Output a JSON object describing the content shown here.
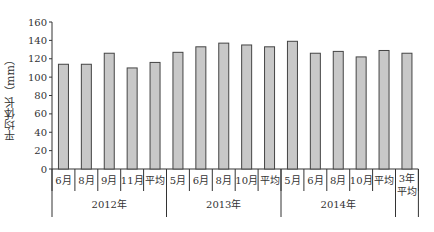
{
  "chart_data": {
    "type": "bar",
    "title": "",
    "xlabel": "",
    "ylabel": "平均体长（mm）",
    "ylim": [
      0,
      160
    ],
    "yticks": [
      0,
      20,
      40,
      60,
      80,
      100,
      120,
      140,
      160
    ],
    "grid": false,
    "legend": null,
    "bar_color": "#c8c8c8",
    "bar_edge_color": "#444444",
    "categories": [
      "6月",
      "8月",
      "9月",
      "11月",
      "平均",
      "5月",
      "6月",
      "8月",
      "10月",
      "平均",
      "5月",
      "6月",
      "8月",
      "10月",
      "平均",
      "3年平均"
    ],
    "groups": [
      {
        "label": "2012年",
        "categories": [
          "6月",
          "8月",
          "9月",
          "11月",
          "平均"
        ],
        "values": [
          114,
          114,
          126,
          110,
          116
        ]
      },
      {
        "label": "2013年",
        "categories": [
          "5月",
          "6月",
          "8月",
          "10月",
          "平均"
        ],
        "values": [
          127,
          133,
          137,
          135,
          133
        ]
      },
      {
        "label": "2014年",
        "categories": [
          "5月",
          "6月",
          "8月",
          "10月",
          "平均"
        ],
        "values": [
          139,
          126,
          128,
          122,
          129
        ]
      },
      {
        "label": "",
        "categories": [
          "3年平均"
        ],
        "values": [
          126
        ]
      }
    ],
    "values": [
      114,
      114,
      126,
      110,
      116,
      127,
      133,
      137,
      135,
      133,
      139,
      126,
      128,
      122,
      129,
      126
    ]
  }
}
